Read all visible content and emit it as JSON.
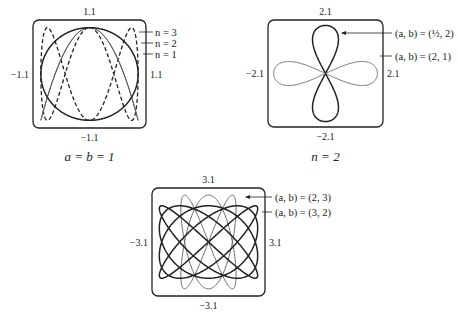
{
  "chart_data": [
    {
      "type": "line",
      "title": "",
      "caption": "a = b = 1",
      "box": {
        "x": 33,
        "y": 20,
        "w": 113,
        "h": 108
      },
      "range": 1.1,
      "ticks": {
        "top": "1.1",
        "bottom": "−1.1",
        "left": "−1.1",
        "right": "1.1"
      },
      "series": [
        {
          "name": "n = 3",
          "a": 1,
          "b": 1,
          "n": 3,
          "style": "dashed",
          "color": "#222222",
          "width": 1.3
        },
        {
          "name": "n = 2",
          "a": 1,
          "b": 1,
          "n": 2,
          "style": "solid",
          "color": "#555555",
          "width": 1.0
        },
        {
          "name": "n = 1",
          "a": 1,
          "b": 1,
          "n": 1,
          "style": "solid",
          "color": "#222222",
          "width": 1.5
        }
      ],
      "legend": [
        {
          "label": "n = 3",
          "y": 35
        },
        {
          "label": "n = 2",
          "y": 46
        },
        {
          "label": "n = 1",
          "y": 57
        }
      ]
    },
    {
      "type": "line",
      "title": "",
      "caption": "n = 2",
      "box": {
        "x": 268,
        "y": 20,
        "w": 115,
        "h": 107
      },
      "range": 2.1,
      "ticks": {
        "top": "2.1",
        "bottom": "−2.1",
        "left": "−2.1",
        "right": "2.1"
      },
      "series": [
        {
          "name": "(a, b) = (1/2, 2)",
          "a": 0.5,
          "b": 2,
          "n": 2,
          "style": "solid",
          "color": "#222222",
          "width": 1.5
        },
        {
          "name": "(a, b) = (2, 1)",
          "a": 2,
          "b": 1,
          "n": 2,
          "style": "solid",
          "color": "#666666",
          "width": 1.0
        }
      ],
      "legend": [
        {
          "label": "(a, b) = (½, 2)",
          "y": 33
        },
        {
          "label": "(a, b) = (2, 1)",
          "y": 56
        }
      ]
    },
    {
      "type": "line",
      "title": "",
      "caption": "",
      "box": {
        "x": 152,
        "y": 188,
        "w": 113,
        "h": 108
      },
      "range": 3.1,
      "ticks": {
        "top": "3.1",
        "bottom": "−3.1",
        "left": "−3.1",
        "right": "3.1"
      },
      "series": [
        {
          "name": "(a, b) = (2, 3)",
          "a": 2,
          "b": 3,
          "n": 5,
          "style": "solid",
          "color": "#666666",
          "width": 1.0
        },
        {
          "name": "(a, b) = (3, 2)",
          "a": 3,
          "b": 2,
          "n": 5,
          "style": "solid",
          "color": "#222222",
          "width": 1.5
        }
      ],
      "legend": [
        {
          "label": "(a, b) = (2, 3)",
          "y": 197
        },
        {
          "label": "(a, b) = (3, 2)",
          "y": 212
        }
      ]
    }
  ],
  "captions": {
    "fig1": "a = b = 1",
    "fig2": "n = 2"
  }
}
